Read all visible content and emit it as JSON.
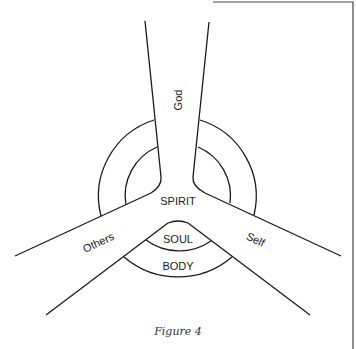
{
  "figure": {
    "caption": "Figure 4",
    "center_label": "SPIRIT",
    "arms": {
      "top": "God",
      "left": "Others",
      "right": "Self"
    },
    "inner_labels": {
      "soul": "SOUL",
      "body": "BODY"
    },
    "colors": {
      "line": "#1a1a1a",
      "background": "#ffffff"
    }
  }
}
